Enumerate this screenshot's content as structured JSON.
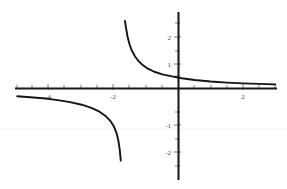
{
  "chart_data": {
    "type": "line",
    "title": "",
    "subtitle": "",
    "xlabel": "",
    "ylabel": "",
    "xlim": [
      -5.0,
      3.05
    ],
    "ylim": [
      -2.8,
      2.75
    ],
    "grid": false,
    "legend": null,
    "x_ticks": [
      -4,
      -2,
      2
    ],
    "x_tick_labels": [
      "-4",
      "-2",
      "2"
    ],
    "y_ticks": [
      2,
      1,
      -1,
      -2
    ],
    "y_tick_labels": [
      "2",
      "1",
      "-1",
      "-2"
    ],
    "x_minor_ticks": [
      -4.5,
      -3.5,
      -3,
      -2.5,
      -1.5,
      -1,
      -0.5,
      0.5,
      1,
      1.5,
      2.5,
      3
    ],
    "y_minor_ticks": [
      2.5,
      1.5,
      0.5,
      -0.5,
      -1.5,
      -2.5
    ],
    "asymptotes": {
      "vertical": -1.72,
      "horizontal": 0.0
    },
    "y_intercept": 0.55,
    "series": [
      {
        "name": "upper-branch",
        "comment": "x > vertical asymptote",
        "x": [
          -1.66,
          -1.62,
          -1.58,
          -1.52,
          -1.45,
          -1.35,
          -1.25,
          -1.1,
          -0.95,
          -0.75,
          -0.5,
          -0.2,
          0.1,
          0.5,
          1.0,
          1.5,
          2.0,
          2.5,
          3.0
        ],
        "y": [
          2.62,
          2.3,
          2.02,
          1.72,
          1.48,
          1.25,
          1.08,
          0.9,
          0.77,
          0.65,
          0.55,
          0.47,
          0.4,
          0.33,
          0.27,
          0.23,
          0.2,
          0.18,
          0.16
        ]
      },
      {
        "name": "lower-branch",
        "comment": "x < vertical asymptote",
        "x": [
          -5.0,
          -4.6,
          -4.2,
          -3.8,
          -3.4,
          -3.0,
          -2.7,
          -2.45,
          -2.25,
          -2.1,
          -2.0,
          -1.92,
          -1.86,
          -1.82,
          -1.79
        ],
        "y": [
          -0.3,
          -0.34,
          -0.38,
          -0.44,
          -0.52,
          -0.63,
          -0.75,
          -0.9,
          -1.08,
          -1.28,
          -1.48,
          -1.74,
          -2.05,
          -2.4,
          -2.8
        ]
      }
    ]
  }
}
